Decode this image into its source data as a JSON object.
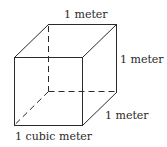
{
  "diagram": {
    "type": "cube",
    "labels": {
      "top_edge": "1 meter",
      "right_edge": "1 meter",
      "depth_edge": "1 meter",
      "volume": "1 cubic meter"
    },
    "colors": {
      "line": "#2a2a2a",
      "background": "#ffffff"
    }
  }
}
